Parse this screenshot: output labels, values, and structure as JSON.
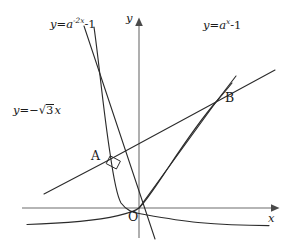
{
  "figure": {
    "kind": "math-diagram",
    "background_color": "#ffffff",
    "stroke_color": "#2b2b2b",
    "axis_color": "#6d6d6d",
    "axes": {
      "x_label": "x",
      "y_label": "y",
      "origin_label": "O",
      "origin_px": {
        "x": 139,
        "y": 208
      },
      "x_axis_y_px": 208,
      "y_axis_x_px": 139
    },
    "labels": {
      "curve_left": {
        "text": "y = a^{-2x} - 1",
        "lhs": "y",
        "equals": "=",
        "base": "a",
        "exponent": "-2x",
        "tail": "-1"
      },
      "curve_right": {
        "text": "y = a^{x} - 1",
        "lhs": "y",
        "equals": "=",
        "base": "a",
        "exponent": "x",
        "tail": "-1"
      },
      "line": {
        "text": "y = -√3 x",
        "lhs": "y",
        "equals": "=",
        "sign": "−",
        "radical": "√",
        "radicand": "3",
        "variable": "x"
      },
      "point_a": "A",
      "point_b": "B"
    },
    "annotations": [
      {
        "name": "right-angle-marker",
        "at_px": {
          "x": 113,
          "y": 163
        },
        "meaning": "perpendicular intersection at A"
      }
    ],
    "geometry": {
      "curve_exp_x": "y = a^x - 1 through O and B, asymptote y = -1 to the left",
      "curve_exp_neg2x": "y = a^{-2x} - 1 through A and O, asymptote y = -1 to the right",
      "line_neg_sqrt3": "y = -sqrt(3) x, steep descending line through A and O",
      "line_ob": "shallow ascending line through O and B",
      "points": [
        {
          "label": "A",
          "px": {
            "x": 107,
            "y": 161
          }
        },
        {
          "label": "B",
          "px": {
            "x": 216,
            "y": 102
          }
        },
        {
          "label": "O",
          "px": {
            "x": 139,
            "y": 208
          }
        }
      ]
    }
  }
}
